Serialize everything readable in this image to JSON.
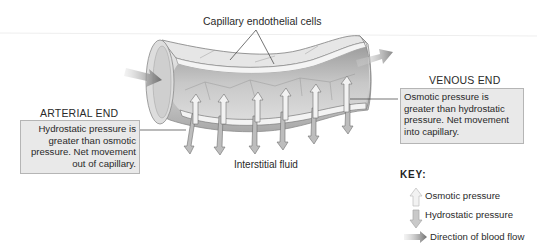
{
  "diagram": {
    "type": "capillary exchange illustration",
    "labels": {
      "endothelial": "Capillary endothelial cells",
      "interstitial": "Interstitial fluid"
    },
    "arterial_end": {
      "heading": "ARTERIAL END",
      "lines": [
        "Hydrostatic pressure is",
        "greater than osmotic",
        "pressure. Net movement",
        "out of capillary."
      ]
    },
    "venous_end": {
      "heading": "VENOUS END",
      "lines": [
        "Osmotic pressure is",
        "greater than hydrostatic",
        "pressure.  Net movement",
        "into capillary."
      ]
    },
    "key": {
      "title": "KEY:",
      "items": [
        {
          "icon": "up-arrow-icon",
          "label": "Osmotic pressure"
        },
        {
          "icon": "down-arrow-icon",
          "label": "Hydrostatic pressure"
        },
        {
          "icon": "flow-arrow-icon",
          "label": "Direction of blood flow"
        }
      ]
    },
    "colors": {
      "box_fill": "#e9e9e9",
      "box_border": "#b5b5b5",
      "vessel_light": "#e2e2e2",
      "vessel_dark": "#9a9a9a",
      "flow_arrow": "#7a7a7a",
      "osmotic_arrow": "#f2f2f2",
      "hydrostatic_arrow": "#bdbdbd"
    }
  }
}
